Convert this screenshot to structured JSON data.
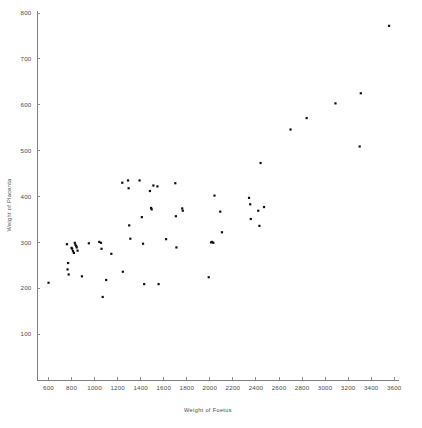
{
  "chart_data": {
    "type": "scatter",
    "title": "",
    "xlabel": "Weight of Foetus",
    "ylabel": "Weight of Placenta",
    "xlim": [
      500,
      3650
    ],
    "ylim": [
      0,
      800
    ],
    "xticks": [
      600,
      800,
      1000,
      1200,
      1400,
      1600,
      1800,
      2000,
      2200,
      2400,
      2600,
      2800,
      3000,
      3200,
      3400,
      3600
    ],
    "yticks": [
      100,
      200,
      300,
      400,
      500,
      600,
      700,
      800
    ],
    "xtick_labels": [
      "600",
      "800",
      "1000",
      "1200",
      "1400",
      "1600",
      "1800",
      "2000",
      "2200",
      "2400",
      "2600",
      "2800",
      "3000",
      "3200",
      "3400",
      "3600"
    ],
    "ytick_labels": [
      "100",
      "200",
      "300",
      "400",
      "500",
      "600",
      "700",
      "800"
    ],
    "grid": false,
    "legend": null,
    "marker": "square",
    "marker_color": "#101010",
    "marker_size": 2.2,
    "point_count": 63,
    "points": [
      [
        600,
        212
      ],
      [
        760,
        296
      ],
      [
        765,
        241
      ],
      [
        770,
        255
      ],
      [
        775,
        230
      ],
      [
        800,
        288
      ],
      [
        805,
        286
      ],
      [
        812,
        281
      ],
      [
        820,
        277
      ],
      [
        828,
        299
      ],
      [
        833,
        295
      ],
      [
        840,
        292
      ],
      [
        845,
        289
      ],
      [
        852,
        282
      ],
      [
        890,
        226
      ],
      [
        950,
        298
      ],
      [
        1040,
        301
      ],
      [
        1055,
        299
      ],
      [
        1060,
        286
      ],
      [
        1070,
        181
      ],
      [
        1100,
        218
      ],
      [
        1145,
        275
      ],
      [
        1240,
        430
      ],
      [
        1245,
        236
      ],
      [
        1290,
        435
      ],
      [
        1295,
        418
      ],
      [
        1300,
        337
      ],
      [
        1310,
        308
      ],
      [
        1390,
        435
      ],
      [
        1410,
        355
      ],
      [
        1420,
        297
      ],
      [
        1430,
        209
      ],
      [
        1480,
        412
      ],
      [
        1490,
        375
      ],
      [
        1495,
        372
      ],
      [
        1510,
        424
      ],
      [
        1545,
        422
      ],
      [
        1555,
        209
      ],
      [
        1620,
        307
      ],
      [
        1700,
        429
      ],
      [
        1705,
        357
      ],
      [
        1710,
        289
      ],
      [
        1760,
        374
      ],
      [
        1765,
        369
      ],
      [
        1990,
        224
      ],
      [
        2010,
        300
      ],
      [
        2020,
        301
      ],
      [
        2030,
        299
      ],
      [
        2040,
        402
      ],
      [
        2090,
        367
      ],
      [
        2105,
        322
      ],
      [
        2340,
        397
      ],
      [
        2350,
        383
      ],
      [
        2355,
        351
      ],
      [
        2420,
        369
      ],
      [
        2430,
        336
      ],
      [
        2440,
        473
      ],
      [
        2470,
        377
      ],
      [
        2700,
        546
      ],
      [
        2840,
        571
      ],
      [
        3090,
        603
      ],
      [
        3300,
        509
      ],
      [
        3310,
        625
      ],
      [
        3555,
        772
      ]
    ]
  },
  "axes": {
    "x_axis_name": "x-axis",
    "y_axis_name": "y-axis"
  }
}
